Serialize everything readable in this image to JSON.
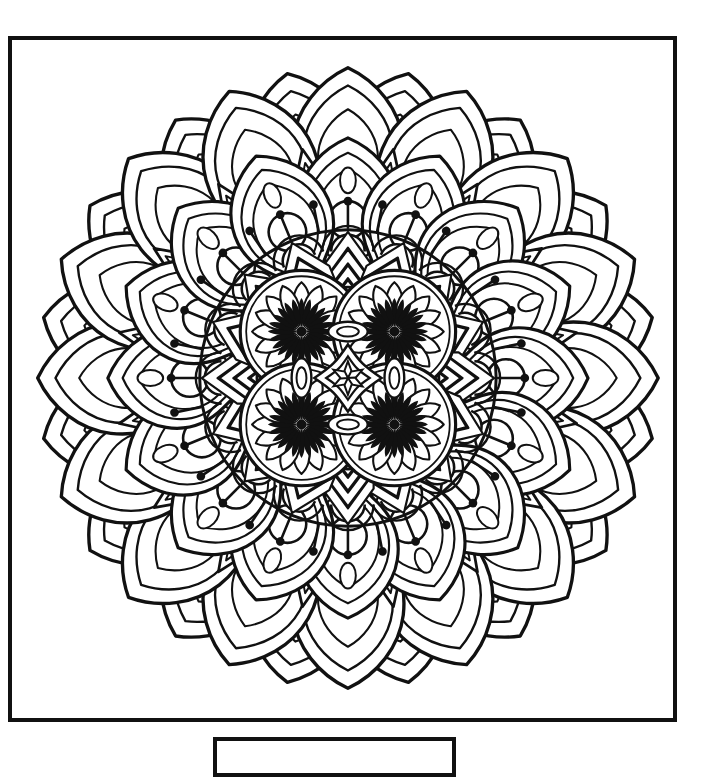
{
  "page": {
    "background_color": "#ffffff",
    "width": 711,
    "height": 756
  },
  "art_frame": {
    "name": "coloring-page-border",
    "stroke_color": "#111111",
    "stroke_width": 4,
    "fill_color": "#ffffff"
  },
  "caption_box": {
    "name": "caption-box",
    "stroke_color": "#111111",
    "stroke_width": 4,
    "text": ""
  },
  "artwork": {
    "title": "Mandala Coloring Page",
    "style": "black line art on white, uncolored",
    "line_color": "#111111",
    "fill_color": "#ffffff",
    "center_x": 348,
    "center_y": 378,
    "rings": [
      {
        "name": "outer-petal-ring",
        "symmetry": 16,
        "radius_outer": 322,
        "radius_inner": 232,
        "motif": "pointed-lotus-petal"
      },
      {
        "name": "second-petal-ring",
        "symmetry": 16,
        "radius_outer": 240,
        "radius_inner": 170,
        "motif": "nested-ogee-petal-with-circle"
      },
      {
        "name": "dotted-pin-ring",
        "symmetry": 32,
        "radius_outer": 176,
        "radius_inner": 150,
        "motif": "radiating-dot-tipped-pins"
      },
      {
        "name": "chevron-fan-ring",
        "symmetry": 16,
        "radius_outer": 150,
        "radius_inner": 92,
        "motif": "nested-chevron-fan"
      },
      {
        "name": "quad-circle-core",
        "symmetry": 4,
        "radius_outer": 92,
        "radius_inner": 0,
        "motif": "four-overlapping-starburst-circles"
      }
    ]
  },
  "chart_data": {
    "type": "pie",
    "categories": [
      "outer-petal-ring",
      "second-petal-ring",
      "dotted-pin-ring",
      "chevron-fan-ring",
      "quad-circle-core"
    ],
    "values": [
      16,
      16,
      32,
      16,
      4
    ],
    "xlabel": "ring",
    "ylabel": "repeat count"
  }
}
